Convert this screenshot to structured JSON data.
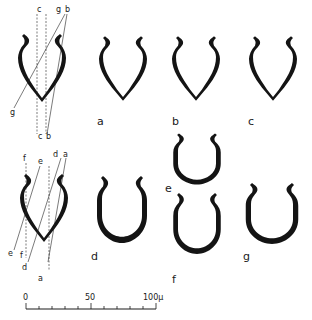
{
  "figure": {
    "ink_color": "#141414",
    "background": "#ffffff"
  },
  "reference_top": {
    "plane_labels_top": [
      "c",
      "g",
      "b"
    ],
    "plane_labels_bottom": [
      "g",
      "c",
      "b"
    ]
  },
  "reference_bottom": {
    "plane_labels_top": [
      "f",
      "e",
      "d",
      "a"
    ],
    "plane_labels_bottom": [
      "e",
      "f",
      "d",
      "a"
    ]
  },
  "sections": [
    {
      "id": "a",
      "label": "a"
    },
    {
      "id": "b",
      "label": "b"
    },
    {
      "id": "c",
      "label": "c"
    },
    {
      "id": "d",
      "label": "d"
    },
    {
      "id": "e",
      "label": "e"
    },
    {
      "id": "f",
      "label": "f"
    },
    {
      "id": "g",
      "label": "g"
    }
  ],
  "scale_bar": {
    "labels": [
      "0",
      "50",
      "100µ"
    ],
    "ticks": 10
  }
}
